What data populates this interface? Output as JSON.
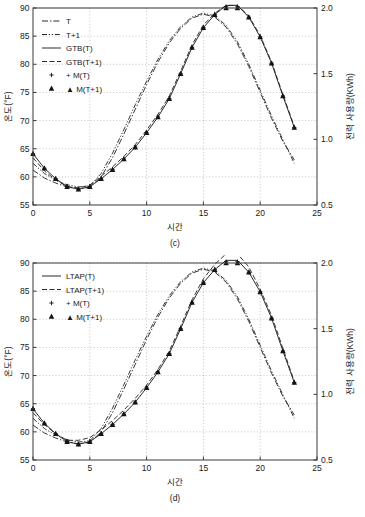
{
  "figure": {
    "panels": [
      {
        "id": "c",
        "label": "(c)",
        "xlabel": "시간",
        "ylabel_left": "온도(°F)",
        "ylabel_right": "전력 사용량(KWh)",
        "legend": [
          {
            "label": "T",
            "style": "dashdot"
          },
          {
            "label": "T+1",
            "style": "dashdot2"
          },
          {
            "label": "GTB(T)",
            "style": "solid"
          },
          {
            "label": "GTB(T+1)",
            "style": "dashed"
          },
          {
            "label": "+ M(T)",
            "style": "plus"
          },
          {
            "label": "▲ M(T+1)",
            "style": "triangle"
          }
        ]
      },
      {
        "id": "d",
        "label": "(d)",
        "xlabel": "시간",
        "ylabel_left": "온도(°F)",
        "ylabel_right": "전력 사용량(KWh)",
        "legend": [
          {
            "label": "LTAP(T)",
            "style": "solid"
          },
          {
            "label": "LTAP(T+1)",
            "style": "dashed"
          },
          {
            "label": "+ M(T)",
            "style": "plus"
          },
          {
            "label": "▲ M(T+1)",
            "style": "triangle"
          }
        ]
      }
    ]
  },
  "chart_data": [
    {
      "type": "line",
      "title": "(c)",
      "xlabel": "시간",
      "ylabel": "온도(°F)",
      "ylabel_right": "전력 사용량(KWh)",
      "xlim": [
        0,
        25
      ],
      "ylim": [
        55,
        90
      ],
      "ylim_right": [
        0.5,
        2.0
      ],
      "xticks": [
        0,
        5,
        10,
        15,
        20,
        25
      ],
      "yticks": [
        55,
        60,
        65,
        70,
        75,
        80,
        85,
        90
      ],
      "yticks_right": [
        0.5,
        1.0,
        1.5,
        2.0
      ],
      "grid": true,
      "legend_position": "upper-left",
      "x": [
        0,
        1,
        2,
        3,
        4,
        5,
        6,
        7,
        8,
        9,
        10,
        11,
        12,
        13,
        14,
        15,
        16,
        17,
        18,
        19,
        20,
        21,
        22,
        23
      ],
      "series": [
        {
          "name": "T",
          "axis": "left",
          "style": "dashdot",
          "values": [
            61.2,
            59.8,
            58.9,
            58.2,
            57.9,
            58.1,
            60.0,
            63.4,
            67.6,
            72.0,
            76.4,
            80.4,
            83.8,
            86.4,
            88.2,
            88.9,
            88.4,
            86.6,
            83.6,
            79.6,
            75.0,
            70.4,
            66.3,
            63.0
          ]
        },
        {
          "name": "T+1",
          "axis": "left",
          "style": "dashdot2",
          "values": [
            62.4,
            60.6,
            59.4,
            58.6,
            58.2,
            58.4,
            60.6,
            64.2,
            68.4,
            72.8,
            77.0,
            80.9,
            84.2,
            86.7,
            88.4,
            89.1,
            88.6,
            86.9,
            84.0,
            80.0,
            75.4,
            70.8,
            66.6,
            62.4
          ]
        },
        {
          "name": "GTB(T)",
          "axis": "right",
          "style": "solid",
          "values": [
            0.89,
            0.78,
            0.7,
            0.64,
            0.62,
            0.64,
            0.7,
            0.77,
            0.85,
            0.94,
            1.05,
            1.17,
            1.31,
            1.5,
            1.7,
            1.85,
            1.95,
            2.02,
            2.02,
            1.93,
            1.78,
            1.58,
            1.33,
            1.09
          ]
        },
        {
          "name": "GTB(T+1)",
          "axis": "right",
          "style": "dashed",
          "values": [
            0.86,
            0.76,
            0.69,
            0.64,
            0.63,
            0.65,
            0.72,
            0.79,
            0.87,
            0.96,
            1.07,
            1.19,
            1.33,
            1.52,
            1.72,
            1.87,
            1.96,
            2.02,
            2.02,
            1.94,
            1.79,
            1.59,
            1.34,
            1.1
          ]
        },
        {
          "name": "M(T)",
          "axis": "right",
          "style": "plus",
          "values": [
            0.89,
            0.78,
            0.7,
            0.64,
            0.62,
            0.64,
            0.7,
            0.77,
            0.85,
            0.94,
            1.05,
            1.17,
            1.31,
            1.5,
            1.7,
            1.85,
            1.95,
            2.01,
            2.01,
            1.93,
            1.78,
            1.58,
            1.33,
            1.09
          ]
        },
        {
          "name": "M(T+1)",
          "axis": "right",
          "style": "triangle",
          "values": [
            0.89,
            0.78,
            0.7,
            0.64,
            0.62,
            0.64,
            0.7,
            0.77,
            0.85,
            0.94,
            1.05,
            1.17,
            1.31,
            1.5,
            1.7,
            1.85,
            1.95,
            2.0,
            2.0,
            1.93,
            1.78,
            1.58,
            1.33,
            1.09
          ]
        }
      ]
    },
    {
      "type": "line",
      "title": "(d)",
      "xlabel": "시간",
      "ylabel": "온도(°F)",
      "ylabel_right": "전력 사용량(KWh)",
      "xlim": [
        0,
        25
      ],
      "ylim": [
        55,
        90
      ],
      "ylim_right": [
        0.5,
        2.0
      ],
      "xticks": [
        0,
        5,
        10,
        15,
        20,
        25
      ],
      "yticks": [
        55,
        60,
        65,
        70,
        75,
        80,
        85,
        90
      ],
      "yticks_right": [
        0.5,
        1.0,
        1.5,
        2.0
      ],
      "grid": true,
      "legend_position": "upper-left",
      "x": [
        0,
        1,
        2,
        3,
        4,
        5,
        6,
        7,
        8,
        9,
        10,
        11,
        12,
        13,
        14,
        15,
        16,
        17,
        18,
        19,
        20,
        21,
        22,
        23
      ],
      "series": [
        {
          "name": "LTAP(T)",
          "axis": "right",
          "style": "solid",
          "values": [
            0.89,
            0.78,
            0.7,
            0.64,
            0.62,
            0.64,
            0.7,
            0.77,
            0.85,
            0.94,
            1.05,
            1.17,
            1.31,
            1.5,
            1.7,
            1.85,
            1.95,
            2.02,
            2.02,
            1.93,
            1.78,
            1.58,
            1.33,
            1.09
          ]
        },
        {
          "name": "LTAP(T+1)",
          "axis": "right",
          "style": "dashed",
          "values": [
            0.86,
            0.77,
            0.7,
            0.65,
            0.65,
            0.67,
            0.73,
            0.8,
            0.88,
            0.97,
            1.07,
            1.19,
            1.33,
            1.52,
            1.72,
            1.88,
            1.99,
            2.07,
            2.07,
            1.97,
            1.8,
            1.6,
            1.35,
            1.1
          ]
        },
        {
          "name": "T",
          "axis": "left",
          "style": "dashdot",
          "values": [
            61.2,
            59.8,
            58.9,
            58.2,
            57.9,
            58.1,
            60.0,
            63.4,
            67.6,
            72.0,
            76.4,
            80.4,
            83.8,
            86.4,
            88.2,
            88.9,
            88.4,
            86.6,
            83.6,
            79.6,
            75.0,
            70.4,
            66.3,
            63.0
          ]
        },
        {
          "name": "T+1",
          "axis": "left",
          "style": "dashdot2",
          "values": [
            62.4,
            60.6,
            59.4,
            58.6,
            58.2,
            58.4,
            60.6,
            64.2,
            68.4,
            72.8,
            77.0,
            80.9,
            84.2,
            86.7,
            88.4,
            89.1,
            88.6,
            86.9,
            84.0,
            80.0,
            75.4,
            70.8,
            66.6,
            62.4
          ]
        },
        {
          "name": "M(T)",
          "axis": "right",
          "style": "plus",
          "values": [
            0.89,
            0.78,
            0.7,
            0.64,
            0.62,
            0.64,
            0.7,
            0.77,
            0.85,
            0.94,
            1.05,
            1.17,
            1.31,
            1.5,
            1.7,
            1.85,
            1.95,
            2.01,
            2.01,
            1.93,
            1.78,
            1.58,
            1.33,
            1.09
          ]
        },
        {
          "name": "M(T+1)",
          "axis": "right",
          "style": "triangle",
          "values": [
            0.89,
            0.78,
            0.7,
            0.64,
            0.62,
            0.64,
            0.7,
            0.77,
            0.85,
            0.94,
            1.05,
            1.17,
            1.31,
            1.5,
            1.7,
            1.85,
            1.95,
            2.0,
            2.0,
            1.93,
            1.78,
            1.58,
            1.33,
            1.09
          ]
        }
      ]
    }
  ]
}
